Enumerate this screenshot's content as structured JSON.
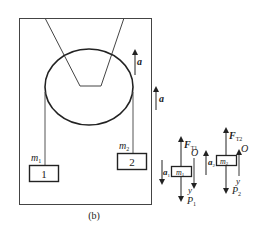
{
  "figure": {
    "caption": "(b)",
    "elevator_accel_label": "a",
    "frame_accel_label": "a"
  },
  "masses": {
    "m1": {
      "symbol": "m",
      "subscript": "1",
      "box_label": "1"
    },
    "m2": {
      "symbol": "m",
      "subscript": "2",
      "box_label": "2"
    }
  },
  "free_body": {
    "body1": {
      "tension": "F",
      "tension_sub": "T1",
      "accel": "a",
      "accel_sub": "1",
      "mass": "m",
      "mass_sub": "1",
      "weight": "P",
      "weight_sub": "1",
      "origin": "O",
      "axis": "y"
    },
    "body2": {
      "tension": "F",
      "tension_sub": "T2",
      "accel": "a",
      "accel_sub": "2",
      "mass": "m",
      "mass_sub": "2",
      "weight": "P",
      "weight_sub": "2",
      "origin": "O",
      "axis": "y"
    }
  },
  "colors": {
    "line": "#3a3a3a",
    "stroke_dark": "#222222"
  }
}
